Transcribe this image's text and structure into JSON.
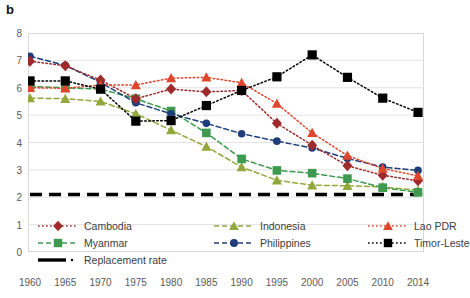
{
  "panel": {
    "label": "b"
  },
  "axes": {
    "y_ticks": [
      "0",
      "1",
      "2",
      "3",
      "4",
      "5",
      "6",
      "7",
      "8"
    ],
    "x_ticks": [
      "1960",
      "1965",
      "1970",
      "1975",
      "1980",
      "1985",
      "1990",
      "1995",
      "2000",
      "2005",
      "2010",
      "2014"
    ]
  },
  "legend": {
    "items": [
      {
        "name": "Cambodia",
        "color": "#9e2a2b",
        "marker": "diamond",
        "dash": "dotted"
      },
      {
        "name": "Indonesia",
        "color": "#93a83c",
        "marker": "triangle",
        "dash": "dashed"
      },
      {
        "name": "Lao PDR",
        "color": "#e0462c",
        "marker": "triangle",
        "dash": "dotted"
      },
      {
        "name": "Myanmar",
        "color": "#3d9a4e",
        "marker": "square",
        "dash": "dashed"
      },
      {
        "name": "Philippines",
        "color": "#1f3d7a",
        "marker": "circle",
        "dash": "dashed"
      },
      {
        "name": "Timor-Leste",
        "color": "#000000",
        "marker": "square",
        "dash": "dotted"
      },
      {
        "name": "Replacement rate",
        "color": "#000000",
        "marker": "none",
        "dash": "thick-dash"
      }
    ]
  },
  "chart_data": {
    "type": "line",
    "title": "",
    "xlabel": "",
    "ylabel": "",
    "ylim": [
      0,
      8
    ],
    "grid": true,
    "legend_position": "bottom",
    "categories": [
      "1960",
      "1965",
      "1970",
      "1975",
      "1980",
      "1985",
      "1990",
      "1995",
      "2000",
      "2005",
      "2010",
      "2014"
    ],
    "series": [
      {
        "name": "Cambodia",
        "color": "#9e2a2b",
        "marker": "diamond",
        "dash": "dotted",
        "values": [
          6.97,
          6.8,
          6.28,
          5.6,
          5.95,
          5.85,
          5.9,
          4.7,
          3.9,
          3.15,
          2.8,
          2.6
        ]
      },
      {
        "name": "Indonesia",
        "color": "#93a83c",
        "marker": "triangle",
        "dash": "dashed",
        "values": [
          5.62,
          5.6,
          5.5,
          5.05,
          4.45,
          3.85,
          3.1,
          2.62,
          2.44,
          2.42,
          2.38,
          2.25
        ]
      },
      {
        "name": "Lao PDR",
        "color": "#e0462c",
        "marker": "triangle",
        "dash": "dotted",
        "values": [
          6.0,
          5.98,
          6.1,
          6.1,
          6.35,
          6.38,
          6.18,
          5.42,
          4.35,
          3.52,
          3.05,
          2.78
        ]
      },
      {
        "name": "Myanmar",
        "color": "#3d9a4e",
        "marker": "square",
        "dash": "dashed",
        "values": [
          6.05,
          6.0,
          5.95,
          5.6,
          5.15,
          4.35,
          3.4,
          2.98,
          2.88,
          2.68,
          2.35,
          2.18
        ]
      },
      {
        "name": "Philippines",
        "color": "#1f3d7a",
        "marker": "circle",
        "dash": "dashed",
        "values": [
          7.15,
          6.82,
          6.2,
          5.45,
          5.05,
          4.7,
          4.32,
          4.05,
          3.8,
          3.42,
          3.1,
          2.98
        ]
      },
      {
        "name": "Timor-Leste",
        "color": "#000000",
        "marker": "square",
        "dash": "dotted",
        "values": [
          6.25,
          6.25,
          5.95,
          4.78,
          4.8,
          5.35,
          5.9,
          6.4,
          7.2,
          6.38,
          5.62,
          5.1
        ]
      },
      {
        "name": "Replacement rate",
        "color": "#000000",
        "marker": "none",
        "dash": "thick-dash",
        "values": [
          2.1,
          2.1,
          2.1,
          2.1,
          2.1,
          2.1,
          2.1,
          2.1,
          2.1,
          2.1,
          2.1,
          2.1
        ]
      }
    ]
  }
}
